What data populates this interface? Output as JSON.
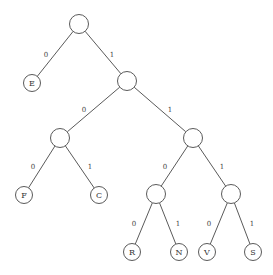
{
  "diagram": {
    "type": "binary-tree",
    "nodes": [
      {
        "id": "root",
        "x": 79,
        "y": 24,
        "r": 9.5,
        "label": ""
      },
      {
        "id": "E",
        "x": 32,
        "y": 83,
        "r": 8.5,
        "label": "E"
      },
      {
        "id": "n1",
        "x": 127,
        "y": 81,
        "r": 9.5,
        "label": ""
      },
      {
        "id": "n10",
        "x": 60,
        "y": 138,
        "r": 9.5,
        "label": ""
      },
      {
        "id": "n11",
        "x": 193,
        "y": 138,
        "r": 9.5,
        "label": ""
      },
      {
        "id": "F",
        "x": 24,
        "y": 195,
        "r": 8.5,
        "label": "F"
      },
      {
        "id": "C",
        "x": 99,
        "y": 195,
        "r": 8.5,
        "label": "C"
      },
      {
        "id": "n110",
        "x": 156,
        "y": 194,
        "r": 9.5,
        "label": ""
      },
      {
        "id": "n111",
        "x": 231,
        "y": 194,
        "r": 9.5,
        "label": ""
      },
      {
        "id": "R",
        "x": 132,
        "y": 252,
        "r": 8.5,
        "label": "R"
      },
      {
        "id": "N",
        "x": 179,
        "y": 252,
        "r": 8.5,
        "label": "N"
      },
      {
        "id": "V",
        "x": 207,
        "y": 252,
        "r": 8.5,
        "label": "V"
      },
      {
        "id": "S",
        "x": 253,
        "y": 252,
        "r": 8.5,
        "label": "S"
      }
    ],
    "edges": [
      {
        "from": "root",
        "to": "E",
        "label": "0",
        "lx": 46,
        "ly": 55
      },
      {
        "from": "root",
        "to": "n1",
        "label": "1",
        "lx": 112,
        "ly": 55
      },
      {
        "from": "n1",
        "to": "n10",
        "label": "0",
        "lx": 84,
        "ly": 110
      },
      {
        "from": "n1",
        "to": "n11",
        "label": "1",
        "lx": 170,
        "ly": 110
      },
      {
        "from": "n10",
        "to": "F",
        "label": "0",
        "lx": 33,
        "ly": 167
      },
      {
        "from": "n10",
        "to": "C",
        "label": "1",
        "lx": 90,
        "ly": 167
      },
      {
        "from": "n11",
        "to": "n110",
        "label": "0",
        "lx": 165,
        "ly": 167
      },
      {
        "from": "n11",
        "to": "n111",
        "label": "1",
        "lx": 222,
        "ly": 167
      },
      {
        "from": "n110",
        "to": "R",
        "label": "0",
        "lx": 134,
        "ly": 224
      },
      {
        "from": "n110",
        "to": "N",
        "label": "1",
        "lx": 178,
        "ly": 224
      },
      {
        "from": "n111",
        "to": "V",
        "label": "0",
        "lx": 209,
        "ly": 224
      },
      {
        "from": "n111",
        "to": "S",
        "label": "1",
        "lx": 252,
        "ly": 224
      }
    ],
    "codes": {
      "E": "0",
      "F": "100",
      "C": "101",
      "R": "1100",
      "N": "1101",
      "V": "1110",
      "S": "1111"
    }
  }
}
